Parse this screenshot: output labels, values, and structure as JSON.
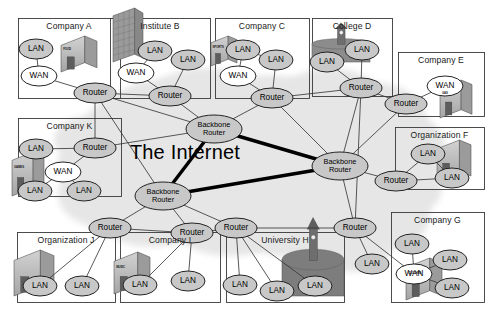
{
  "diagram": {
    "title": "The Internet",
    "center_label": "The Internet",
    "background_color": "#ffffff",
    "cloud_color": "#e6e6e6",
    "node_fill": "#c8c8c8",
    "node_fill_light": "#ffffff",
    "node_stroke": "#1a1a1a",
    "link_color": "#3a3a3a",
    "backbone_link_color": "#000000"
  },
  "frames": [
    {
      "id": "company-a",
      "label": "Company A",
      "x": 18,
      "y": 18,
      "w": 102,
      "h": 80
    },
    {
      "id": "institute-b",
      "label": "Institute B",
      "x": 110,
      "y": 18,
      "w": 100,
      "h": 80
    },
    {
      "id": "company-c",
      "label": "Company C",
      "x": 215,
      "y": 18,
      "w": 94,
      "h": 80
    },
    {
      "id": "college-d",
      "label": "College D",
      "x": 312,
      "y": 18,
      "w": 80,
      "h": 78
    },
    {
      "id": "company-e",
      "label": "Company E",
      "x": 398,
      "y": 52,
      "w": 86,
      "h": 64
    },
    {
      "id": "organization-f",
      "label": "Organization F",
      "x": 395,
      "y": 127,
      "w": 89,
      "h": 62
    },
    {
      "id": "company-g",
      "label": "Company G",
      "x": 391,
      "y": 212,
      "w": 93,
      "h": 90
    },
    {
      "id": "university-h",
      "label": "University H",
      "x": 226,
      "y": 232,
      "w": 118,
      "h": 70
    },
    {
      "id": "company-i",
      "label": "Company I",
      "x": 120,
      "y": 232,
      "w": 100,
      "h": 70
    },
    {
      "id": "organization-j",
      "label": "Organization J",
      "x": 17,
      "y": 232,
      "w": 98,
      "h": 70
    },
    {
      "id": "company-k",
      "label": "Company K",
      "x": 18,
      "y": 118,
      "w": 103,
      "h": 78
    }
  ],
  "buildings": [
    {
      "id": "bld-company-a",
      "tag": "FOOD",
      "x": 61,
      "y": 36,
      "w": 36,
      "h": 36,
      "style": "block",
      "shade": "#b4b4b4"
    },
    {
      "id": "bld-institute-b",
      "tag": "",
      "x": 113,
      "y": 8,
      "w": 30,
      "h": 54,
      "style": "tower",
      "shade": "#9a9a9a"
    },
    {
      "id": "bld-company-c",
      "tag": "SPORTS",
      "x": 211,
      "y": 36,
      "w": 26,
      "h": 30,
      "style": "block",
      "shade": "#b0b0b0"
    },
    {
      "id": "bld-college-d",
      "tag": "",
      "x": 312,
      "y": 36,
      "w": 58,
      "h": 26,
      "style": "campus",
      "shade": "#8c8c8c"
    },
    {
      "id": "bld-company-e",
      "tag": "GAS",
      "x": 440,
      "y": 80,
      "w": 32,
      "h": 38,
      "style": "block",
      "shade": "#b4b4b4"
    },
    {
      "id": "bld-organization-f",
      "tag": "",
      "x": 437,
      "y": 140,
      "w": 34,
      "h": 40,
      "style": "block",
      "shade": "#b4b4b4"
    },
    {
      "id": "bld-company-g",
      "tag": "CLOTHES",
      "x": 406,
      "y": 258,
      "w": 36,
      "h": 42,
      "style": "block",
      "shade": "#a8a8a8"
    },
    {
      "id": "bld-university-h",
      "tag": "",
      "x": 282,
      "y": 244,
      "w": 62,
      "h": 52,
      "style": "campus",
      "shade": "#7d7d7d"
    },
    {
      "id": "bld-company-i",
      "tag": "MUSIC",
      "x": 114,
      "y": 252,
      "w": 36,
      "h": 42,
      "style": "block",
      "shade": "#b4b4b4"
    },
    {
      "id": "bld-organization-j",
      "tag": "",
      "x": 14,
      "y": 250,
      "w": 40,
      "h": 46,
      "style": "block",
      "shade": "#bdbdbd"
    },
    {
      "id": "bld-company-k",
      "tag": "GAMES",
      "x": 12,
      "y": 152,
      "w": 32,
      "h": 44,
      "style": "block",
      "shade": "#9f9f9f"
    }
  ],
  "nodes": [
    {
      "id": "a-lan1",
      "label": "LAN",
      "x": 36,
      "y": 49,
      "rx": 17,
      "ry": 10,
      "fill": "dark",
      "group": "company-a"
    },
    {
      "id": "a-wan",
      "label": "WAN",
      "x": 39,
      "y": 76,
      "rx": 18,
      "ry": 10,
      "fill": "light",
      "group": "company-a"
    },
    {
      "id": "a-router",
      "label": "Router",
      "x": 95,
      "y": 93,
      "rx": 21,
      "ry": 10,
      "fill": "dark",
      "group": "company-a"
    },
    {
      "id": "b-lan1",
      "label": "LAN",
      "x": 155,
      "y": 51,
      "rx": 17,
      "ry": 10,
      "fill": "dark",
      "group": "institute-b"
    },
    {
      "id": "b-wan",
      "label": "WAN",
      "x": 136,
      "y": 73,
      "rx": 18,
      "ry": 10,
      "fill": "light",
      "group": "institute-b"
    },
    {
      "id": "b-lan2",
      "label": "LAN",
      "x": 188,
      "y": 60,
      "rx": 17,
      "ry": 10,
      "fill": "dark",
      "group": "institute-b"
    },
    {
      "id": "b-router",
      "label": "Router",
      "x": 170,
      "y": 96,
      "rx": 21,
      "ry": 10,
      "fill": "dark",
      "group": "institute-b"
    },
    {
      "id": "c-lan1",
      "label": "LAN",
      "x": 243,
      "y": 50,
      "rx": 17,
      "ry": 10,
      "fill": "dark",
      "group": "company-c"
    },
    {
      "id": "c-lan2",
      "label": "LAN",
      "x": 276,
      "y": 60,
      "rx": 17,
      "ry": 10,
      "fill": "dark",
      "group": "company-c"
    },
    {
      "id": "c-wan",
      "label": "WAN",
      "x": 238,
      "y": 76,
      "rx": 18,
      "ry": 10,
      "fill": "light",
      "group": "company-c"
    },
    {
      "id": "c-router",
      "label": "Router",
      "x": 272,
      "y": 98,
      "rx": 21,
      "ry": 10,
      "fill": "dark",
      "group": "company-c"
    },
    {
      "id": "d-lan1",
      "label": "LAN",
      "x": 327,
      "y": 62,
      "rx": 17,
      "ry": 10,
      "fill": "dark",
      "group": "college-d"
    },
    {
      "id": "d-lan2",
      "label": "LAN",
      "x": 362,
      "y": 50,
      "rx": 17,
      "ry": 10,
      "fill": "dark",
      "group": "college-d"
    },
    {
      "id": "d-router",
      "label": "Router",
      "x": 361,
      "y": 88,
      "rx": 21,
      "ry": 10,
      "fill": "dark",
      "group": "college-d"
    },
    {
      "id": "e-wan",
      "label": "WAN",
      "x": 445,
      "y": 86,
      "rx": 18,
      "ry": 10,
      "fill": "light",
      "group": "company-e"
    },
    {
      "id": "e-router",
      "label": "Router",
      "x": 406,
      "y": 104,
      "rx": 21,
      "ry": 10,
      "fill": "dark",
      "group": "company-e"
    },
    {
      "id": "f-lan1",
      "label": "LAN",
      "x": 428,
      "y": 154,
      "rx": 17,
      "ry": 10,
      "fill": "dark",
      "group": "organization-f"
    },
    {
      "id": "f-router",
      "label": "Router",
      "x": 396,
      "y": 181,
      "rx": 21,
      "ry": 10,
      "fill": "dark",
      "group": "organization-f"
    },
    {
      "id": "f-lan2",
      "label": "LAN",
      "x": 452,
      "y": 178,
      "rx": 17,
      "ry": 10,
      "fill": "dark",
      "group": "organization-f"
    },
    {
      "id": "g-lan-out",
      "label": "LAN",
      "x": 372,
      "y": 264,
      "rx": 17,
      "ry": 10,
      "fill": "dark",
      "group": "company-g"
    },
    {
      "id": "g-lan1",
      "label": "LAN",
      "x": 412,
      "y": 244,
      "rx": 17,
      "ry": 10,
      "fill": "dark",
      "group": "company-g"
    },
    {
      "id": "g-lan2",
      "label": "LAN",
      "x": 450,
      "y": 260,
      "rx": 17,
      "ry": 10,
      "fill": "dark",
      "group": "company-g"
    },
    {
      "id": "g-wan",
      "label": "WAN",
      "x": 414,
      "y": 274,
      "rx": 18,
      "ry": 10,
      "fill": "light",
      "group": "company-g"
    },
    {
      "id": "g-lan3",
      "label": "LAN",
      "x": 452,
      "y": 288,
      "rx": 17,
      "ry": 10,
      "fill": "dark",
      "group": "company-g"
    },
    {
      "id": "h-lan1",
      "label": "LAN",
      "x": 240,
      "y": 285,
      "rx": 17,
      "ry": 10,
      "fill": "dark",
      "group": "university-h"
    },
    {
      "id": "h-lan2",
      "label": "LAN",
      "x": 277,
      "y": 291,
      "rx": 17,
      "ry": 10,
      "fill": "dark",
      "group": "university-h"
    },
    {
      "id": "h-lan3",
      "label": "LAN",
      "x": 315,
      "y": 286,
      "rx": 17,
      "ry": 10,
      "fill": "dark",
      "group": "university-h"
    },
    {
      "id": "i-lan1",
      "label": "LAN",
      "x": 140,
      "y": 285,
      "rx": 17,
      "ry": 10,
      "fill": "dark",
      "group": "company-i"
    },
    {
      "id": "i-lan2",
      "label": "LAN",
      "x": 188,
      "y": 281,
      "rx": 17,
      "ry": 10,
      "fill": "dark",
      "group": "company-i"
    },
    {
      "id": "j-lan1",
      "label": "LAN",
      "x": 40,
      "y": 286,
      "rx": 17,
      "ry": 10,
      "fill": "dark",
      "group": "organization-j"
    },
    {
      "id": "j-lan2",
      "label": "LAN",
      "x": 82,
      "y": 286,
      "rx": 17,
      "ry": 10,
      "fill": "dark",
      "group": "organization-j"
    },
    {
      "id": "k-lan1",
      "label": "LAN",
      "x": 36,
      "y": 149,
      "rx": 17,
      "ry": 10,
      "fill": "dark",
      "group": "company-k"
    },
    {
      "id": "k-router",
      "label": "Router",
      "x": 95,
      "y": 148,
      "rx": 21,
      "ry": 10,
      "fill": "dark",
      "group": "company-k"
    },
    {
      "id": "k-wan",
      "label": "WAN",
      "x": 63,
      "y": 172,
      "rx": 18,
      "ry": 10,
      "fill": "light",
      "group": "company-k"
    },
    {
      "id": "k-lan2",
      "label": "LAN",
      "x": 35,
      "y": 191,
      "rx": 17,
      "ry": 10,
      "fill": "dark",
      "group": "company-k"
    },
    {
      "id": "k-lan3",
      "label": "LAN",
      "x": 84,
      "y": 191,
      "rx": 17,
      "ry": 10,
      "fill": "dark",
      "group": "company-k"
    },
    {
      "id": "bb-top",
      "label": "Backbone Router",
      "x": 214,
      "y": 129,
      "rx": 28,
      "ry": 14,
      "fill": "dark",
      "group": "backbone"
    },
    {
      "id": "bb-right",
      "label": "Backbone Router",
      "x": 340,
      "y": 166,
      "rx": 28,
      "ry": 14,
      "fill": "dark",
      "group": "backbone"
    },
    {
      "id": "bb-left",
      "label": "Backbone Router",
      "x": 163,
      "y": 196,
      "rx": 28,
      "ry": 14,
      "fill": "dark",
      "group": "backbone"
    },
    {
      "id": "r-j",
      "label": "Router",
      "x": 110,
      "y": 228,
      "rx": 21,
      "ry": 10,
      "fill": "dark",
      "group": "access"
    },
    {
      "id": "r-i",
      "label": "Router",
      "x": 192,
      "y": 233,
      "rx": 21,
      "ry": 10,
      "fill": "dark",
      "group": "access"
    },
    {
      "id": "r-h",
      "label": "Router",
      "x": 236,
      "y": 228,
      "rx": 21,
      "ry": 10,
      "fill": "dark",
      "group": "access"
    },
    {
      "id": "r-g",
      "label": "Router",
      "x": 355,
      "y": 228,
      "rx": 21,
      "ry": 10,
      "fill": "dark",
      "group": "access"
    }
  ],
  "links": [
    {
      "from": "a-lan1",
      "to": "a-wan",
      "weight": "thin"
    },
    {
      "from": "a-wan",
      "to": "a-router",
      "weight": "thin"
    },
    {
      "from": "b-lan1",
      "to": "b-wan",
      "weight": "thin"
    },
    {
      "from": "b-wan",
      "to": "b-router",
      "weight": "thin"
    },
    {
      "from": "b-lan2",
      "to": "b-router",
      "weight": "thin"
    },
    {
      "from": "a-router",
      "to": "b-router",
      "weight": "thin"
    },
    {
      "from": "c-lan1",
      "to": "c-wan",
      "weight": "thin"
    },
    {
      "from": "c-lan1",
      "to": "c-lan2",
      "weight": "thin"
    },
    {
      "from": "c-lan2",
      "to": "c-router",
      "weight": "thin"
    },
    {
      "from": "c-wan",
      "to": "c-router",
      "weight": "thin"
    },
    {
      "from": "d-lan1",
      "to": "d-router",
      "weight": "thin"
    },
    {
      "from": "d-lan2",
      "to": "d-router",
      "weight": "thin"
    },
    {
      "from": "c-router",
      "to": "d-router",
      "weight": "thin"
    },
    {
      "from": "e-wan",
      "to": "e-router",
      "weight": "thin"
    },
    {
      "from": "d-router",
      "to": "e-router",
      "weight": "thin"
    },
    {
      "from": "f-lan1",
      "to": "f-router",
      "weight": "thin"
    },
    {
      "from": "f-lan2",
      "to": "f-router",
      "weight": "thin"
    },
    {
      "from": "f-lan1",
      "to": "f-lan2",
      "weight": "thin"
    },
    {
      "from": "k-lan1",
      "to": "k-router",
      "weight": "thin"
    },
    {
      "from": "k-wan",
      "to": "k-router",
      "weight": "thin"
    },
    {
      "from": "k-wan",
      "to": "k-lan2",
      "weight": "thin"
    },
    {
      "from": "k-wan",
      "to": "k-lan3",
      "weight": "thin"
    },
    {
      "from": "a-router",
      "to": "bb-top",
      "weight": "thin"
    },
    {
      "from": "b-router",
      "to": "bb-top",
      "weight": "thin"
    },
    {
      "from": "c-router",
      "to": "bb-top",
      "weight": "thin"
    },
    {
      "from": "k-router",
      "to": "bb-top",
      "weight": "thin"
    },
    {
      "from": "a-router",
      "to": "k-router",
      "weight": "thin"
    },
    {
      "from": "a-router",
      "to": "bb-left",
      "weight": "thin"
    },
    {
      "from": "c-router",
      "to": "bb-right",
      "weight": "thin"
    },
    {
      "from": "d-router",
      "to": "bb-right",
      "weight": "thin"
    },
    {
      "from": "d-router",
      "to": "r-g",
      "weight": "thin"
    },
    {
      "from": "e-router",
      "to": "bb-right",
      "weight": "thin"
    },
    {
      "from": "f-router",
      "to": "bb-right",
      "weight": "thin"
    },
    {
      "from": "bb-right",
      "to": "r-g",
      "weight": "thin"
    },
    {
      "from": "bb-left",
      "to": "r-j",
      "weight": "thin"
    },
    {
      "from": "bb-left",
      "to": "r-i",
      "weight": "thin"
    },
    {
      "from": "bb-left",
      "to": "r-h",
      "weight": "thin"
    },
    {
      "from": "r-j",
      "to": "r-i",
      "weight": "thin"
    },
    {
      "from": "r-i",
      "to": "r-h",
      "weight": "thin"
    },
    {
      "from": "r-h",
      "to": "r-g",
      "weight": "thin"
    },
    {
      "from": "r-j",
      "to": "j-lan1",
      "weight": "thin"
    },
    {
      "from": "r-j",
      "to": "j-lan2",
      "weight": "thin"
    },
    {
      "from": "r-i",
      "to": "i-lan1",
      "weight": "thin"
    },
    {
      "from": "r-i",
      "to": "i-lan2",
      "weight": "thin"
    },
    {
      "from": "r-h",
      "to": "h-lan1",
      "weight": "thin"
    },
    {
      "from": "r-h",
      "to": "h-lan2",
      "weight": "thin"
    },
    {
      "from": "r-h",
      "to": "h-lan3",
      "weight": "thin"
    },
    {
      "from": "r-g",
      "to": "g-lan-out",
      "weight": "thin"
    },
    {
      "from": "r-g",
      "to": "g-wan",
      "weight": "thin"
    },
    {
      "from": "g-wan",
      "to": "g-lan1",
      "weight": "thin"
    },
    {
      "from": "g-wan",
      "to": "g-lan2",
      "weight": "thin"
    },
    {
      "from": "g-wan",
      "to": "g-lan3",
      "weight": "thin"
    },
    {
      "from": "bb-top",
      "to": "bb-right",
      "weight": "thick"
    },
    {
      "from": "bb-top",
      "to": "bb-left",
      "weight": "thick"
    },
    {
      "from": "bb-left",
      "to": "bb-right",
      "weight": "thick"
    }
  ],
  "center_text": {
    "label": "The Internet",
    "x": 185,
    "y": 152
  }
}
